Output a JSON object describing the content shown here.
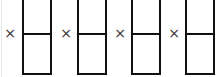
{
  "diagram": {
    "operator": "×",
    "groups": [
      {
        "operator": "×",
        "cells": [
          "",
          ""
        ]
      },
      {
        "operator": "×",
        "cells": [
          "",
          ""
        ]
      },
      {
        "operator": "×",
        "cells": [
          "",
          ""
        ]
      },
      {
        "operator": "×",
        "cells": [
          "",
          ""
        ]
      }
    ]
  }
}
